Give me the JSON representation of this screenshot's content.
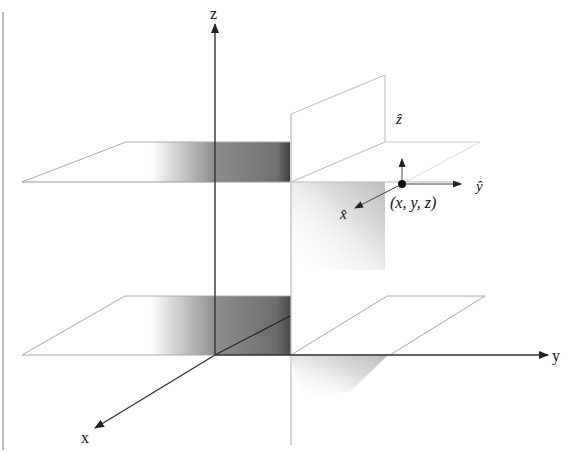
{
  "diagram": {
    "axes": {
      "x_label": "x",
      "y_label": "y",
      "z_label": "z"
    },
    "unit_vectors": {
      "x_hat": "x̂",
      "y_hat": "ŷ",
      "z_hat": "ẑ"
    },
    "point_label": "(x, y, z)",
    "colors": {
      "axis": "#333333",
      "plane_edge": "#aaaaaa",
      "shade_dark": "#4a4a4a",
      "shade_mid": "#8a8a8a",
      "background": "#ffffff"
    }
  }
}
